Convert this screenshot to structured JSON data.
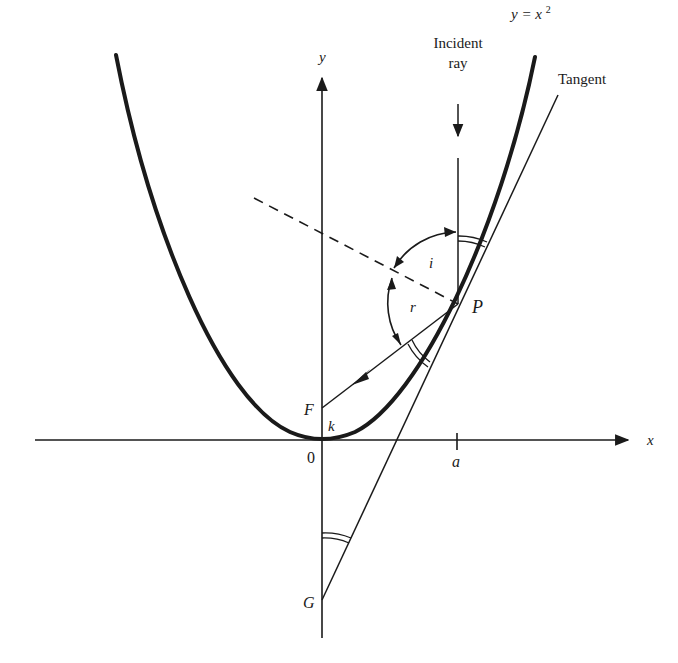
{
  "diagram": {
    "labels": {
      "curve": "y = x",
      "curve_exp": "2",
      "incident_line1": "Incident",
      "incident_line2": "ray",
      "tangent": "Tangent",
      "y_axis": "y",
      "x_axis": "x",
      "origin": "0",
      "a_tick": "a",
      "point_P": "P",
      "focus_F": "F",
      "point_G": "G",
      "k": "k",
      "angle_i": "i",
      "angle_r": "r"
    },
    "colors": {
      "ink": "#1a1a1a",
      "background": "#ffffff"
    }
  }
}
